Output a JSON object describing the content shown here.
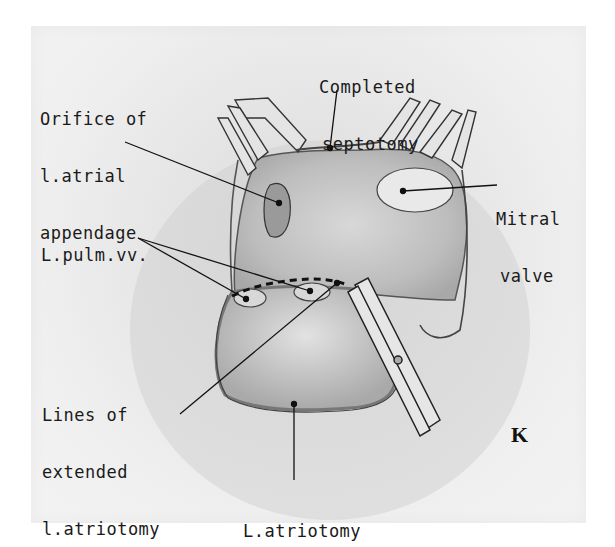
{
  "figure": {
    "letter": "K"
  },
  "labels": {
    "septotomy": {
      "line1": "Completed",
      "line2": "septotomy"
    },
    "orifice": {
      "line1": "Orifice of",
      "line2": "l.atrial",
      "line3": "appendage"
    },
    "mitral": {
      "line1": "Mitral",
      "line2": "valve"
    },
    "pulm": {
      "line1": "L.pulm.vv."
    },
    "extended": {
      "line1": "Lines of",
      "line2": "extended",
      "line3": "l.atriotomy"
    },
    "atriotomy": {
      "line1": "L.atriotomy"
    }
  },
  "colors": {
    "ink": "#1a1a1a",
    "paper": "#ececec",
    "tissue": "#c8c8c8"
  }
}
